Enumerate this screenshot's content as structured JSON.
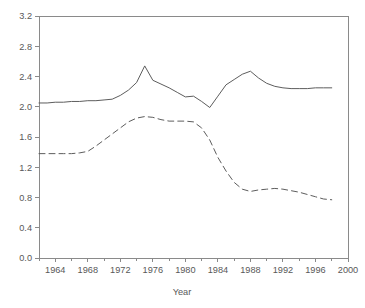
{
  "chart_data": {
    "type": "line",
    "title": "",
    "xlabel": "Year",
    "ylabel": "",
    "xlim": [
      1962,
      2000
    ],
    "ylim": [
      0.0,
      3.2
    ],
    "grid": false,
    "legend": "none",
    "x_ticks_major": [
      1964,
      1968,
      1972,
      1976,
      1980,
      1984,
      1988,
      1992,
      1996,
      2000
    ],
    "x_tick_labels": [
      "1964",
      "1968",
      "1972",
      "1976",
      "1980",
      "1984",
      "1988",
      "1992",
      "1996",
      "2000"
    ],
    "x_ticks_minor": [
      1962,
      1966,
      1970,
      1974,
      1978,
      1982,
      1986,
      1990,
      1994,
      1998
    ],
    "y_ticks": [
      0.0,
      0.4,
      0.8,
      1.2,
      1.6,
      2.0,
      2.4,
      2.8,
      3.2
    ],
    "y_tick_labels": [
      "0.0",
      "0.4",
      "0.8",
      "1.2",
      "1.6",
      "2.0",
      "2.4",
      "2.8",
      "3.2"
    ],
    "series": [
      {
        "name": "solid-series",
        "style": "solid",
        "color": "#5d5d5d",
        "x": [
          1962,
          1963,
          1964,
          1965,
          1966,
          1967,
          1968,
          1969,
          1970,
          1971,
          1972,
          1973,
          1974,
          1975,
          1976,
          1977,
          1978,
          1979,
          1980,
          1981,
          1982,
          1983,
          1984,
          1985,
          1986,
          1987,
          1988,
          1989,
          1990,
          1991,
          1992,
          1993,
          1994,
          1995,
          1996,
          1997,
          1998
        ],
        "values": [
          2.05,
          2.05,
          2.06,
          2.06,
          2.07,
          2.07,
          2.08,
          2.08,
          2.09,
          2.1,
          2.15,
          2.22,
          2.32,
          2.54,
          2.35,
          2.3,
          2.25,
          2.19,
          2.13,
          2.14,
          2.07,
          1.99,
          2.14,
          2.29,
          2.36,
          2.43,
          2.47,
          2.38,
          2.31,
          2.27,
          2.25,
          2.24,
          2.24,
          2.24,
          2.25,
          2.25,
          2.25
        ]
      },
      {
        "name": "dashed-series",
        "style": "dashed",
        "color": "#5d5d5d",
        "x": [
          1962,
          1963,
          1964,
          1965,
          1966,
          1967,
          1968,
          1969,
          1970,
          1971,
          1972,
          1973,
          1974,
          1975,
          1976,
          1977,
          1978,
          1979,
          1980,
          1981,
          1982,
          1983,
          1984,
          1985,
          1986,
          1987,
          1988,
          1989,
          1990,
          1991,
          1992,
          1993,
          1994,
          1995,
          1996,
          1997,
          1998
        ],
        "values": [
          1.38,
          1.38,
          1.38,
          1.38,
          1.38,
          1.39,
          1.41,
          1.48,
          1.56,
          1.64,
          1.72,
          1.8,
          1.85,
          1.87,
          1.86,
          1.83,
          1.81,
          1.81,
          1.81,
          1.8,
          1.72,
          1.56,
          1.33,
          1.15,
          1.0,
          0.91,
          0.88,
          0.9,
          0.91,
          0.92,
          0.91,
          0.89,
          0.87,
          0.84,
          0.81,
          0.78,
          0.77
        ]
      }
    ]
  },
  "axes": {
    "x_axis_title": "Year"
  }
}
